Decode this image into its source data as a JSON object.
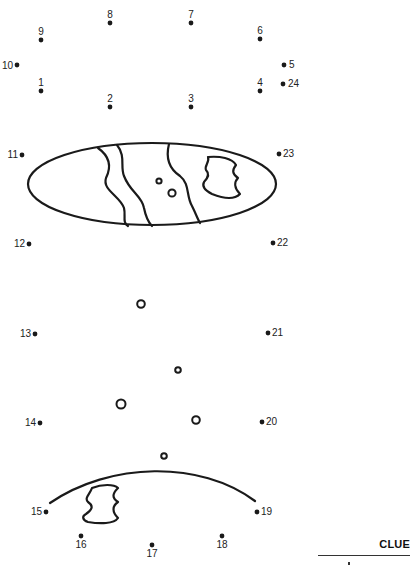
{
  "puzzle": {
    "ink_color": "#1a1a1a",
    "dots": [
      {
        "n": "1",
        "x": 41,
        "y": 91,
        "lx": 41,
        "ly": 86,
        "anchor": "middle"
      },
      {
        "n": "2",
        "x": 110,
        "y": 107,
        "lx": 110,
        "ly": 102,
        "anchor": "middle"
      },
      {
        "n": "3",
        "x": 191,
        "y": 107,
        "lx": 191,
        "ly": 102,
        "anchor": "middle"
      },
      {
        "n": "4",
        "x": 260,
        "y": 91,
        "lx": 260,
        "ly": 86,
        "anchor": "middle"
      },
      {
        "n": "5",
        "x": 284,
        "y": 65,
        "lx": 289,
        "ly": 68,
        "anchor": "start"
      },
      {
        "n": "6",
        "x": 260,
        "y": 39,
        "lx": 260,
        "ly": 34,
        "anchor": "middle"
      },
      {
        "n": "7",
        "x": 191,
        "y": 23,
        "lx": 191,
        "ly": 18,
        "anchor": "middle"
      },
      {
        "n": "8",
        "x": 110,
        "y": 23,
        "lx": 110,
        "ly": 18,
        "anchor": "middle"
      },
      {
        "n": "9",
        "x": 41,
        "y": 40,
        "lx": 41,
        "ly": 35,
        "anchor": "middle"
      },
      {
        "n": "10",
        "x": 17,
        "y": 65,
        "lx": 13,
        "ly": 69,
        "anchor": "end"
      },
      {
        "n": "11",
        "x": 22,
        "y": 155,
        "lx": 18,
        "ly": 158,
        "anchor": "end"
      },
      {
        "n": "12",
        "x": 29,
        "y": 244,
        "lx": 25,
        "ly": 247,
        "anchor": "end"
      },
      {
        "n": "13",
        "x": 35,
        "y": 334,
        "lx": 31,
        "ly": 337,
        "anchor": "end"
      },
      {
        "n": "14",
        "x": 40,
        "y": 423,
        "lx": 36,
        "ly": 426,
        "anchor": "end"
      },
      {
        "n": "15",
        "x": 46,
        "y": 512,
        "lx": 42,
        "ly": 515,
        "anchor": "end"
      },
      {
        "n": "16",
        "x": 81,
        "y": 536,
        "lx": 81,
        "ly": 548,
        "anchor": "middle"
      },
      {
        "n": "17",
        "x": 152,
        "y": 545,
        "lx": 152,
        "ly": 557,
        "anchor": "middle"
      },
      {
        "n": "18",
        "x": 222,
        "y": 536,
        "lx": 222,
        "ly": 548,
        "anchor": "middle"
      },
      {
        "n": "19",
        "x": 257,
        "y": 512,
        "lx": 261,
        "ly": 515,
        "anchor": "start"
      },
      {
        "n": "20",
        "x": 262,
        "y": 422,
        "lx": 266,
        "ly": 425,
        "anchor": "start"
      },
      {
        "n": "21",
        "x": 268,
        "y": 333,
        "lx": 272,
        "ly": 336,
        "anchor": "start"
      },
      {
        "n": "22",
        "x": 273,
        "y": 243,
        "lx": 277,
        "ly": 246,
        "anchor": "start"
      },
      {
        "n": "23",
        "x": 279,
        "y": 154,
        "lx": 283,
        "ly": 157,
        "anchor": "start"
      },
      {
        "n": "24",
        "x": 283,
        "y": 84,
        "lx": 288,
        "ly": 87,
        "anchor": "start"
      }
    ],
    "bubbles": [
      {
        "cx": 141,
        "cy": 304,
        "r": 3.8
      },
      {
        "cx": 178,
        "cy": 370,
        "r": 2.8
      },
      {
        "cx": 121,
        "cy": 404,
        "r": 4.5
      },
      {
        "cx": 196,
        "cy": 420,
        "r": 3.8
      },
      {
        "cx": 164,
        "cy": 456,
        "r": 2.8
      },
      {
        "cx": 159,
        "cy": 181,
        "r": 2.6
      },
      {
        "cx": 172,
        "cy": 193,
        "r": 3.6
      }
    ],
    "clue": {
      "label": "CLUE"
    }
  }
}
